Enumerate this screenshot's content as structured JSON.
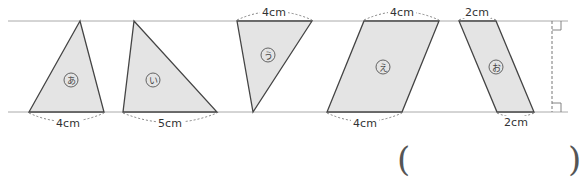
{
  "diagram": {
    "parallel_lines": {
      "top_y": 21,
      "bottom_y": 112,
      "x_start": 8,
      "x_end": 568
    },
    "fill_color": "#e4e4e4",
    "stroke_color": "#444444",
    "line_color": "#aaaaaa",
    "shapes": [
      {
        "id": "a",
        "label": "あ",
        "type": "triangle",
        "points": "80,21 29,112 104,112",
        "label_pos": [
          71,
          80
        ],
        "dimension": {
          "text": "4cm",
          "side": "bottom",
          "x1": 29,
          "x2": 104
        }
      },
      {
        "id": "i",
        "label": "い",
        "type": "triangle",
        "points": "134,21 123,112 217,112",
        "label_pos": [
          153,
          80
        ],
        "dimension": {
          "text": "5cm",
          "side": "bottom",
          "x1": 123,
          "x2": 217
        }
      },
      {
        "id": "u",
        "label": "う",
        "type": "triangle",
        "points": "237,21 312,21 253,112",
        "label_pos": [
          268,
          55
        ],
        "dimension": {
          "text": "4cm",
          "side": "top",
          "x1": 237,
          "x2": 312
        }
      },
      {
        "id": "e",
        "label": "え",
        "type": "parallelogram",
        "points": "364,21 439,21 402,112 327,112",
        "label_pos": [
          383,
          67
        ],
        "dimension_top": {
          "text": "4cm",
          "x1": 364,
          "x2": 439
        },
        "dimension": {
          "text": "4cm",
          "side": "bottom",
          "x1": 327,
          "x2": 402
        }
      },
      {
        "id": "o",
        "label": "お",
        "type": "parallelogram",
        "points": "459,21 496,21 534,112 497,112",
        "label_pos": [
          496,
          67
        ],
        "dimension_top": {
          "text": "2cm",
          "x1": 459,
          "x2": 496
        },
        "dimension": {
          "text": "2cm",
          "side": "bottom",
          "x1": 497,
          "x2": 534
        }
      }
    ],
    "height_marker": {
      "x": 552,
      "dashed": true,
      "right_angles": true
    }
  },
  "answer_box": {
    "open": "(",
    "close": ")"
  }
}
